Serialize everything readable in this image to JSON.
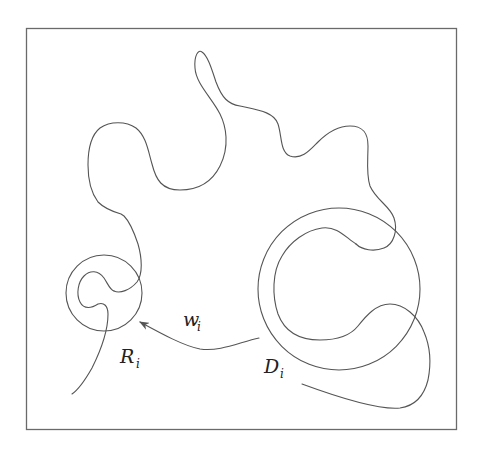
{
  "figure": {
    "colors": {
      "stroke": "#555555",
      "frame": "#6a6a6a",
      "background": "#ffffff",
      "text": "#222222"
    },
    "labels": {
      "w": {
        "main": "w",
        "sub": "i"
      },
      "R": {
        "main": "R",
        "sub": "i"
      },
      "D": {
        "main": "D",
        "sub": "i"
      }
    },
    "elements": [
      {
        "name": "frame",
        "type": "rect"
      },
      {
        "name": "small-circle",
        "label": "R_i",
        "type": "circle"
      },
      {
        "name": "large-circle",
        "label": "D_i",
        "type": "circle"
      },
      {
        "name": "wandering-curve",
        "type": "path"
      },
      {
        "name": "arrow",
        "label": "w_i",
        "type": "arrow",
        "from": "D_i",
        "to": "R_i"
      }
    ]
  }
}
